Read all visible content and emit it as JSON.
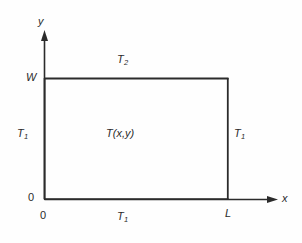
{
  "figure": {
    "type": "technical-diagram",
    "background_color": "#fefefe",
    "line_color": "#2b2b2b",
    "text_color": "#2b2b2b"
  },
  "axes": {
    "x_axis": {
      "name": "x",
      "label": "x",
      "arrow": "arrow-right",
      "origin_label": "0",
      "end_tick_label": "L"
    },
    "y_axis": {
      "name": "y",
      "label": "y",
      "arrow": "arrow-up",
      "origin_label": "0",
      "end_tick_label": "W"
    }
  },
  "domain": {
    "shape": "rectangle",
    "interior_label": "T(x,y)",
    "width_symbol": "L",
    "height_symbol": "W"
  },
  "boundary_conditions": [
    {
      "edge": "top",
      "label_base": "T",
      "label_sub": "2",
      "label_full": "T2"
    },
    {
      "edge": "left",
      "label_base": "T",
      "label_sub": "1",
      "label_full": "T1"
    },
    {
      "edge": "right",
      "label_base": "T",
      "label_sub": "1",
      "label_full": "T1"
    },
    {
      "edge": "bottom",
      "label_base": "T",
      "label_sub": "1",
      "label_full": "T1"
    }
  ],
  "geometry": {
    "rect_left": 44,
    "rect_right": 228,
    "rect_top": 78,
    "rect_bottom": 199,
    "y_axis_arrow_tip": 30,
    "x_axis_arrow_tip": 278
  }
}
